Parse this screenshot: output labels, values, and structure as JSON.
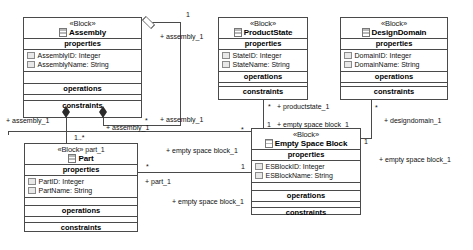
{
  "diagram": {
    "stereotype": "«Block»",
    "section_labels": {
      "properties": "properties",
      "operations": "operations",
      "constraints": "constraints"
    }
  },
  "blocks": [
    {
      "id": "assembly",
      "stereotype": "«Block»",
      "name": "Assembly",
      "name_suffix": "",
      "properties": [
        "AssemblyID: Integer",
        "AssemblyName: String"
      ],
      "operations": [],
      "constraints": []
    },
    {
      "id": "productstate",
      "stereotype": "«Block»",
      "name": "ProductState",
      "name_suffix": "",
      "properties": [
        "StateID: Integer",
        "StateName: String"
      ],
      "operations": [],
      "constraints": []
    },
    {
      "id": "designdomain",
      "stereotype": "«Block»",
      "name": "DesignDomain",
      "name_suffix": "",
      "properties": [
        "DomainID: Integer",
        "DomainName: String"
      ],
      "operations": [],
      "constraints": []
    },
    {
      "id": "part",
      "stereotype": "«Block»",
      "name": "Part",
      "name_suffix": "part_1",
      "properties": [
        "PartID: Integer",
        "PartName: String"
      ],
      "operations": [],
      "constraints": []
    },
    {
      "id": "emptyspaceblock",
      "stereotype": "«Block»",
      "name": "Empty Space Block",
      "name_suffix": "",
      "properties": [
        "ESBlockID: Integer",
        "ESBlockName: String"
      ],
      "operations": [],
      "constraints": []
    }
  ],
  "role_labels": {
    "assembly_left": "+ assembly_1",
    "assembly_mid": "+ assembly_1",
    "assembly_right_upper": "+ assembly_1",
    "assembly_right_lower": "+ assembly_1",
    "productstate_1": "+ productstate_1",
    "esb_top": "+ empty space block_1",
    "esb_left_upper": "+ empty space block_1",
    "esb_left_lower": "+ empty space block_1",
    "esb_right": "+ empty space block_1",
    "part_1": "+ part_1",
    "designdomain_1": "+ designdomain_1"
  },
  "multiplicities": {
    "assembly_top_one": "1",
    "assembly_star": "*",
    "part_one_star": "1..*",
    "productstate_star": "*",
    "esb_one_top": "1",
    "part_star": "*",
    "esb_one_mid": "1",
    "designdomain_star": "*",
    "esb_one_right": "1",
    "esb_star_left": "*"
  },
  "colors": {
    "line": "#4a4a4a",
    "text": "#111111",
    "background": "#ffffff",
    "icon_fill": "#e8e8e8"
  }
}
